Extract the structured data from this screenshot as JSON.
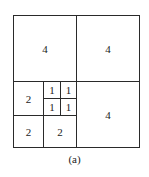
{
  "diagram": {
    "type": "quadtree-partition",
    "cells": [
      {
        "id": "top-left",
        "label": "4",
        "x": 13,
        "y": 15,
        "w": 64,
        "h": 67
      },
      {
        "id": "top-right",
        "label": "4",
        "x": 76,
        "y": 15,
        "w": 64,
        "h": 67
      },
      {
        "id": "bottom-right",
        "label": "4",
        "x": 76,
        "y": 81,
        "w": 64,
        "h": 67
      },
      {
        "id": "mid-left",
        "label": "2",
        "x": 13,
        "y": 81,
        "w": 31,
        "h": 35
      },
      {
        "id": "bottom-left",
        "label": "2",
        "x": 13,
        "y": 115,
        "w": 31,
        "h": 33
      },
      {
        "id": "bottom-mid",
        "label": "2",
        "x": 43,
        "y": 115,
        "w": 34,
        "h": 33
      },
      {
        "id": "small-tl",
        "label": "1",
        "x": 43,
        "y": 81,
        "w": 18,
        "h": 18
      },
      {
        "id": "small-tr",
        "label": "1",
        "x": 60,
        "y": 81,
        "w": 17,
        "h": 18
      },
      {
        "id": "small-bl",
        "label": "1",
        "x": 43,
        "y": 98,
        "w": 18,
        "h": 18
      },
      {
        "id": "small-br",
        "label": "1",
        "x": 60,
        "y": 98,
        "w": 17,
        "h": 18
      }
    ],
    "caption": "(a)"
  }
}
